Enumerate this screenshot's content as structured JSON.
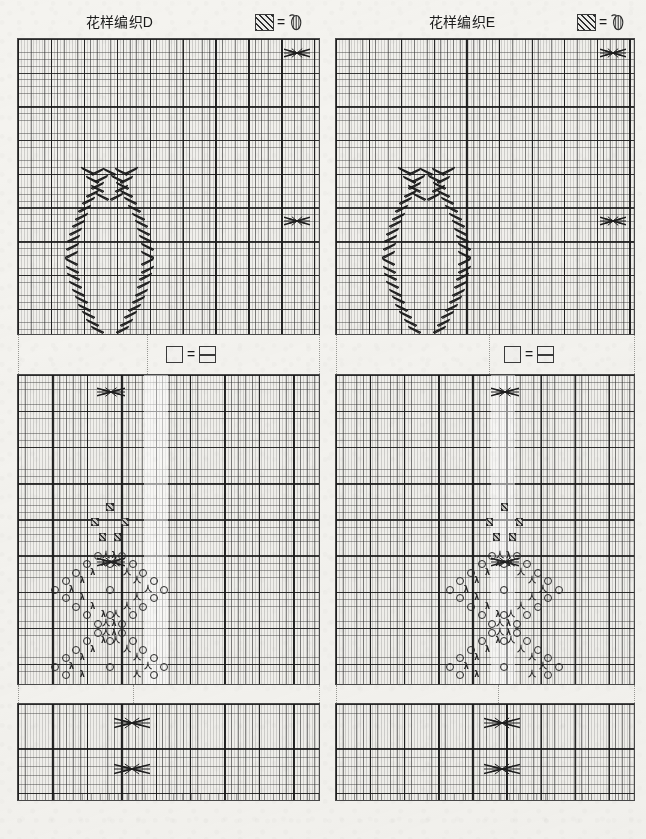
{
  "page": {
    "background_color": "#f4f3ef",
    "ink_color": "#2a2a2a",
    "grid_line_color": "#282828",
    "width": 646,
    "height": 839
  },
  "columns": [
    {
      "id": "D",
      "title": "花样编织D",
      "legend_top": {
        "left_symbol": "hatched-square-icon",
        "equals": "=",
        "right_symbol": "bobble-icon"
      },
      "legend_middle": {
        "left_symbol": "empty-square-icon",
        "equals": "=",
        "right_symbol": "purl-square-icon"
      },
      "charts": [
        {
          "name": "chart-d-top",
          "cols": 46,
          "rows": 44,
          "bold_every_cols": 5,
          "bold_every_rows": 5,
          "motif": "oval-cable-diamond",
          "cable_count": 28
        },
        {
          "name": "chart-d-middle",
          "cols": 44,
          "rows": 43,
          "bold_every_cols": 5,
          "bold_every_rows": 5,
          "motif": "lace-diamond-with-bobbles",
          "bobble_cells": 5,
          "yarn_over_count": 34,
          "decrease_count": 30
        },
        {
          "name": "chart-d-bottom",
          "cols": 44,
          "rows": 11,
          "bold_every_cols": 5,
          "bold_every_rows": 5,
          "motif": "double-cable-cross",
          "cable_count": 2
        }
      ]
    },
    {
      "id": "E",
      "title": "花样编织E",
      "legend_top": {
        "left_symbol": "hatched-square-icon",
        "equals": "=",
        "right_symbol": "bobble-icon"
      },
      "legend_middle": {
        "left_symbol": "empty-square-icon",
        "equals": "=",
        "right_symbol": "purl-square-icon"
      },
      "charts": [
        {
          "name": "chart-e-top",
          "cols": 46,
          "rows": 44,
          "bold_every_cols": 5,
          "bold_every_rows": 5,
          "motif": "oval-cable-diamond",
          "cable_count": 28
        },
        {
          "name": "chart-e-middle",
          "cols": 44,
          "rows": 43,
          "bold_every_cols": 5,
          "bold_every_rows": 5,
          "motif": "lace-diamond-with-bobbles",
          "bobble_cells": 5,
          "yarn_over_count": 34,
          "decrease_count": 30
        },
        {
          "name": "chart-e-bottom",
          "cols": 44,
          "rows": 11,
          "bold_every_cols": 5,
          "bold_every_rows": 5,
          "motif": "double-cable-cross",
          "cable_count": 2
        }
      ]
    }
  ],
  "symbols": {
    "yarn_over": "O",
    "decrease_left": "λ",
    "decrease_right": "人",
    "purl_bar": "—",
    "hatched": "▨"
  }
}
